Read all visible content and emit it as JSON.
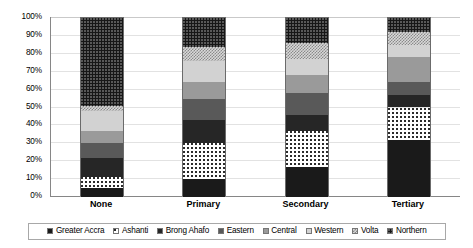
{
  "chart_data": {
    "type": "bar",
    "subtype": "stacked-100-percent",
    "title": "",
    "xlabel": "",
    "ylabel": "",
    "categories": [
      "None",
      "Primary",
      "Secondary",
      "Tertiary"
    ],
    "ylim": [
      0,
      100
    ],
    "ytick_labels": [
      "0%",
      "10%",
      "20%",
      "30%",
      "40%",
      "50%",
      "60%",
      "70%",
      "80%",
      "90%",
      "100%"
    ],
    "ytick_values": [
      0,
      10,
      20,
      30,
      40,
      50,
      60,
      70,
      80,
      90,
      100
    ],
    "grid": true,
    "legend_position": "bottom",
    "units": "percent",
    "series": [
      {
        "name": "Greater Accra",
        "values": [
          5,
          10,
          17,
          32
        ],
        "swatch": "s0"
      },
      {
        "name": "Ashanti",
        "values": [
          6,
          20,
          20,
          18
        ],
        "swatch": "s1"
      },
      {
        "name": "Brong Ahafo",
        "values": [
          11,
          13,
          9,
          7
        ],
        "swatch": "s2"
      },
      {
        "name": "Eastern",
        "values": [
          8,
          12,
          12,
          7
        ],
        "swatch": "s3"
      },
      {
        "name": "Central",
        "values": [
          7,
          9,
          10,
          14
        ],
        "swatch": "s4"
      },
      {
        "name": "Western",
        "values": [
          11,
          12,
          9,
          7
        ],
        "swatch": "s5"
      },
      {
        "name": "Volta",
        "values": [
          3,
          8,
          9,
          7
        ],
        "swatch": "s6"
      },
      {
        "name": "Northern",
        "values": [
          49,
          16,
          14,
          8
        ],
        "swatch": "s7"
      }
    ]
  },
  "colors": {
    "greater_accra": "#1a1a1a",
    "ashanti": "#ffffff",
    "brong_ahafo": "#262626",
    "eastern": "#595959",
    "central": "#9a9a9a",
    "western": "#d2d2d2",
    "volta": "#d8d8d8",
    "northern": "#161616",
    "gridline": "#e2e2e2",
    "axis": "#868686",
    "legend_border": "#a8a8a8",
    "background": "#ffffff"
  }
}
